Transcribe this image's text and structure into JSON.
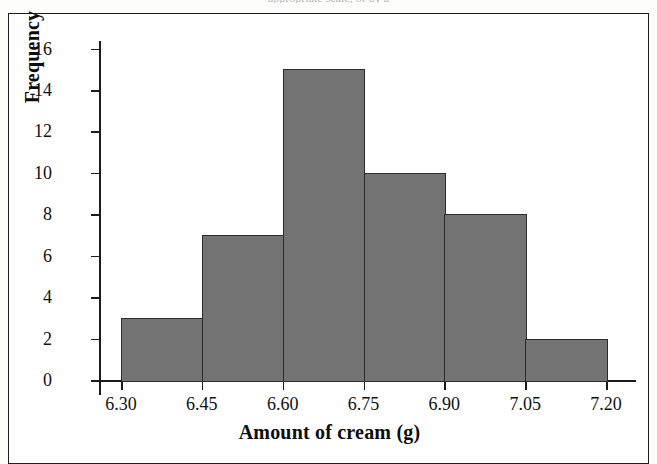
{
  "page": {
    "top_cut_caption": "appropriate scale, or by a",
    "background_color": "#fdfdfb",
    "frame_color": "#1d1d1d"
  },
  "chart_data": {
    "type": "bar",
    "title": "",
    "subtitle": "",
    "xlabel": "Amount of cream (g)",
    "ylabel": "Frequency",
    "categories": [
      "6.30-6.45",
      "6.45-6.60",
      "6.60-6.75",
      "6.75-6.90",
      "6.90-7.05",
      "7.05-7.20"
    ],
    "bin_edges": [
      6.3,
      6.45,
      6.6,
      6.75,
      6.9,
      7.05,
      7.2
    ],
    "values": [
      3,
      7,
      15,
      10,
      8,
      2
    ],
    "bin_width": 0.15,
    "xlim": [
      6.3,
      7.2
    ],
    "ylim": [
      0,
      16
    ],
    "x_ticks": [
      "6.30",
      "6.45",
      "6.60",
      "6.75",
      "6.90",
      "7.05",
      "7.20"
    ],
    "y_ticks": [
      "0",
      "2",
      "4",
      "6",
      "8",
      "10",
      "12",
      "14",
      "16"
    ],
    "grid": false,
    "legend": "none",
    "bar_fill_color": "#737373",
    "bar_edge_color": "#2c2c2c",
    "axis_color": "#1b1b1b"
  }
}
